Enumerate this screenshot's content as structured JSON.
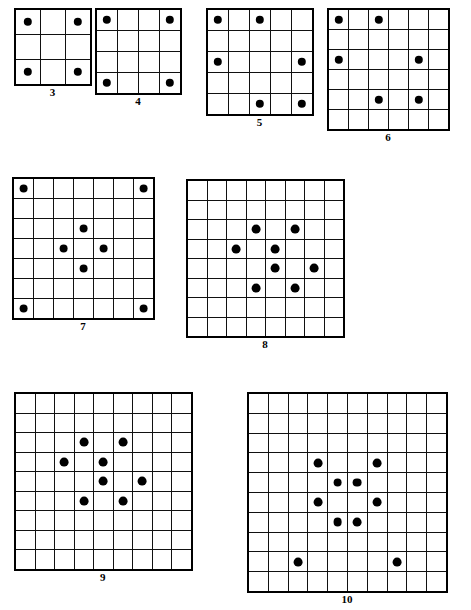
{
  "page": {
    "background_color": "#ffffff",
    "line_color": "#111111",
    "dot_color": "#000000",
    "width": 471,
    "height": 610
  },
  "chart_data": {
    "type": "scatter",
    "xlabel": "",
    "ylabel": "",
    "grid": true,
    "legend": false,
    "note": "Each figure is an n x n square lattice with filled dots placed on certain cells. Coordinates are given as [row, column], 1-indexed from the top-left cell.",
    "figures": [
      {
        "label": "3",
        "size": 3,
        "dot_count": 4,
        "dots": [
          [
            1,
            1
          ],
          [
            1,
            3
          ],
          [
            3,
            1
          ],
          [
            3,
            3
          ]
        ],
        "left": 14,
        "top": 8,
        "cell": 25,
        "dot_radius": 4.2
      },
      {
        "label": "4",
        "size": 4,
        "dot_count": 4,
        "dots": [
          [
            1,
            1
          ],
          [
            1,
            4
          ],
          [
            4,
            1
          ],
          [
            4,
            4
          ]
        ],
        "left": 95,
        "top": 8,
        "cell": 21,
        "dot_radius": 4.2
      },
      {
        "label": "5",
        "size": 5,
        "dot_count": 6,
        "dots": [
          [
            1,
            1
          ],
          [
            1,
            3
          ],
          [
            3,
            1
          ],
          [
            3,
            5
          ],
          [
            5,
            3
          ],
          [
            5,
            5
          ]
        ],
        "left": 206,
        "top": 8,
        "cell": 21,
        "dot_radius": 4.2
      },
      {
        "label": "6",
        "size": 6,
        "dot_count": 6,
        "dots": [
          [
            1,
            1
          ],
          [
            1,
            3
          ],
          [
            3,
            1
          ],
          [
            3,
            5
          ],
          [
            5,
            3
          ],
          [
            5,
            5
          ]
        ],
        "left": 327,
        "top": 8,
        "cell": 20,
        "dot_radius": 4.2
      },
      {
        "label": "7",
        "size": 7,
        "dot_count": 8,
        "dots": [
          [
            1,
            1
          ],
          [
            1,
            7
          ],
          [
            3,
            4
          ],
          [
            4,
            3
          ],
          [
            4,
            5
          ],
          [
            5,
            4
          ],
          [
            7,
            1
          ],
          [
            7,
            7
          ]
        ],
        "left": 12,
        "top": 177,
        "cell": 20,
        "dot_radius": 4.4
      },
      {
        "label": "8",
        "size": 8,
        "dot_count": 8,
        "dots": [
          [
            3,
            4
          ],
          [
            3,
            6
          ],
          [
            4,
            3
          ],
          [
            4,
            5
          ],
          [
            5,
            5
          ],
          [
            5,
            7
          ],
          [
            6,
            4
          ],
          [
            6,
            6
          ]
        ],
        "left": 186,
        "top": 179,
        "cell": 19.5,
        "dot_radius": 4.4
      },
      {
        "label": "9",
        "size": 9,
        "dot_count": 8,
        "dots": [
          [
            3,
            4
          ],
          [
            3,
            6
          ],
          [
            4,
            3
          ],
          [
            4,
            5
          ],
          [
            5,
            5
          ],
          [
            5,
            7
          ],
          [
            6,
            4
          ],
          [
            6,
            6
          ]
        ],
        "left": 14,
        "top": 392,
        "cell": 19.5,
        "dot_radius": 4.4
      },
      {
        "label": "10",
        "size": 10,
        "dot_count": 10,
        "dots": [
          [
            4,
            4
          ],
          [
            4,
            7
          ],
          [
            5,
            5
          ],
          [
            5,
            6
          ],
          [
            6,
            4
          ],
          [
            6,
            7
          ],
          [
            7,
            5
          ],
          [
            7,
            6
          ],
          [
            9,
            3
          ],
          [
            9,
            8
          ]
        ],
        "left": 247,
        "top": 392,
        "cell": 19.8,
        "dot_radius": 4.4
      }
    ]
  }
}
